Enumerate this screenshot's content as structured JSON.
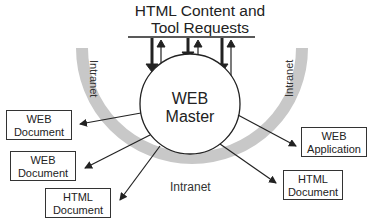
{
  "title": {
    "line1": "HTML Content and",
    "line2": "Tool Requests"
  },
  "center": {
    "line1": "WEB",
    "line2": "Master"
  },
  "ring_labels": {
    "left": "Intranet",
    "right": "Intranet",
    "bottom": "Intranet"
  },
  "nodes": [
    {
      "line1": "WEB",
      "line2": "Document"
    },
    {
      "line1": "WEB",
      "line2": "Document"
    },
    {
      "line1": "HTML",
      "line2": "Document"
    },
    {
      "line1": "HTML",
      "line2": "Document"
    },
    {
      "line1": "WEB",
      "line2": "Application"
    }
  ],
  "colors": {
    "ring": "#c8c8c8",
    "stroke": "#222222"
  }
}
